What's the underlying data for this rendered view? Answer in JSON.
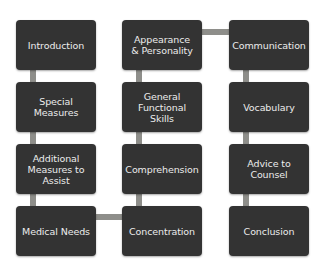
{
  "diagram": {
    "colors": {
      "node_fill": "#333333",
      "node_text": "#ececec",
      "connector": "#8e8e8a",
      "background": "#ffffff"
    },
    "columns": [
      {
        "nodes": [
          {
            "label": "Introduction"
          },
          {
            "label": "Special Measures"
          },
          {
            "label": "Additional Measures to Assist"
          },
          {
            "label": "Medical Needs"
          }
        ]
      },
      {
        "nodes": [
          {
            "label": "Appearance & Personality"
          },
          {
            "label": "General Functional Skills"
          },
          {
            "label": "Comprehension"
          },
          {
            "label": "Concentration"
          }
        ]
      },
      {
        "nodes": [
          {
            "label": "Communication"
          },
          {
            "label": "Vocabulary"
          },
          {
            "label": "Advice to Counsel"
          },
          {
            "label": "Conclusion"
          }
        ]
      }
    ],
    "flow": "snake: column 1 top-to-bottom, Medical Needs → Concentration, column 2 bottom-to-top, Appearance & Personality → Communication, column 3 top-to-bottom"
  }
}
